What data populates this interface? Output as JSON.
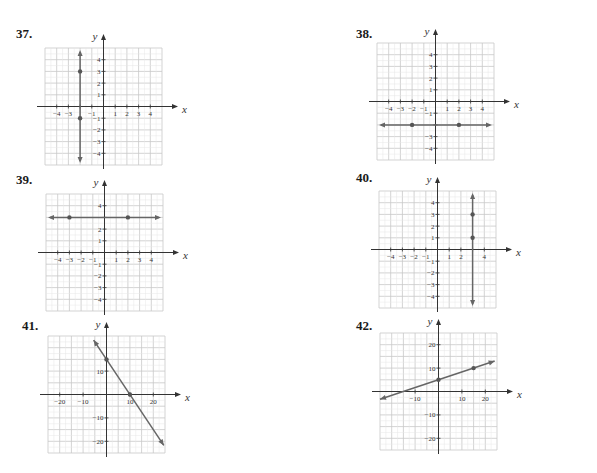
{
  "page": {
    "background": "#ffffff",
    "grid_color": "#c8c8c8",
    "axis_color": "#333333",
    "line_color": "#666666",
    "point_color": "#555555"
  },
  "problems": [
    {
      "number": "37.",
      "label_pos": [
        16,
        38
      ],
      "grid": {
        "left": 45,
        "top": 48,
        "cols": 10,
        "rows": 10,
        "cell": 11.7,
        "origin_col": 5,
        "origin_row": 5
      },
      "axis_labels": {
        "x": "x",
        "y": "y"
      },
      "x_ticks": [
        "−4",
        "−3",
        "",
        "−1",
        "1",
        "2",
        "3",
        "4"
      ],
      "x_tick_values": [
        -4,
        -3,
        -2,
        -1,
        1,
        2,
        3,
        4
      ],
      "y_ticks": [
        "4",
        "3",
        "2",
        "1",
        "−1",
        "−2",
        "−3",
        "−4"
      ],
      "y_tick_values": [
        4,
        3,
        2,
        1,
        -1,
        -2,
        -3,
        -4
      ],
      "unit": 1,
      "line": {
        "type": "vertical",
        "x": -2,
        "points": [
          [
            -2,
            3
          ],
          [
            -2,
            -1
          ]
        ]
      }
    },
    {
      "number": "38.",
      "label_pos": [
        356,
        38
      ],
      "grid": {
        "left": 377,
        "top": 43,
        "cols": 10,
        "rows": 10,
        "cell": 11.7,
        "origin_col": 5,
        "origin_row": 5
      },
      "axis_labels": {
        "x": "x",
        "y": "y"
      },
      "x_ticks": [
        "−4",
        "−3",
        "−2",
        "−1",
        "1",
        "2",
        "3",
        "4"
      ],
      "x_tick_values": [
        -4,
        -3,
        -2,
        -1,
        1,
        2,
        3,
        4
      ],
      "y_ticks": [
        "4",
        "3",
        "2",
        "1",
        "−1",
        "",
        "−3",
        "−4"
      ],
      "y_tick_values": [
        4,
        3,
        2,
        1,
        -1,
        -2,
        -3,
        -4
      ],
      "unit": 1,
      "line": {
        "type": "horizontal",
        "y": -2,
        "points": [
          [
            -2,
            -2
          ],
          [
            2,
            -2
          ]
        ]
      }
    },
    {
      "number": "39.",
      "label_pos": [
        16,
        184
      ],
      "grid": {
        "left": 46,
        "top": 194,
        "cols": 10,
        "rows": 10,
        "cell": 11.7,
        "origin_col": 5,
        "origin_row": 5
      },
      "axis_labels": {
        "x": "x",
        "y": "y"
      },
      "x_ticks": [
        "−4",
        "−3",
        "−2",
        "−1",
        "1",
        "2",
        "3",
        "4"
      ],
      "x_tick_values": [
        -4,
        -3,
        -2,
        -1,
        1,
        2,
        3,
        4
      ],
      "y_ticks": [
        "4",
        "",
        "2",
        "1",
        "−1",
        "−2",
        "−3",
        "−4"
      ],
      "y_tick_values": [
        4,
        3,
        2,
        1,
        -1,
        -2,
        -3,
        -4
      ],
      "unit": 1,
      "line": {
        "type": "horizontal",
        "y": 3,
        "points": [
          [
            -3,
            3
          ],
          [
            2,
            3
          ]
        ]
      }
    },
    {
      "number": "40.",
      "label_pos": [
        356,
        182
      ],
      "grid": {
        "left": 379,
        "top": 191,
        "cols": 10,
        "rows": 10,
        "cell": 11.7,
        "origin_col": 5,
        "origin_row": 5
      },
      "axis_labels": {
        "x": "x",
        "y": "y"
      },
      "x_ticks": [
        "−4",
        "−3",
        "−2",
        "−1",
        "1",
        "2",
        "",
        "4"
      ],
      "x_tick_values": [
        -4,
        -3,
        -2,
        -1,
        1,
        2,
        3,
        4
      ],
      "y_ticks": [
        "4",
        "3",
        "2",
        "1",
        "−1",
        "−2",
        "−3",
        "−4"
      ],
      "y_tick_values": [
        4,
        3,
        2,
        1,
        -1,
        -2,
        -3,
        -4
      ],
      "unit": 1,
      "line": {
        "type": "vertical",
        "x": 3,
        "points": [
          [
            3,
            3
          ],
          [
            3,
            1
          ]
        ]
      }
    },
    {
      "number": "41.",
      "label_pos": [
        22,
        330
      ],
      "grid": {
        "left": 48,
        "top": 336,
        "cols": 10,
        "rows": 10,
        "cell": 11.7,
        "origin_col": 5,
        "origin_row": 5
      },
      "axis_labels": {
        "x": "x",
        "y": "y"
      },
      "x_ticks": [
        "−20",
        "−10",
        "10",
        "20"
      ],
      "x_tick_values": [
        -20,
        -10,
        10,
        20
      ],
      "y_ticks": [
        "10",
        "−10",
        "−20"
      ],
      "y_tick_values": [
        10,
        -10,
        -20
      ],
      "unit": 5,
      "line": {
        "type": "sloped",
        "slope": -1.5,
        "intercept": 15,
        "x_range": [
          -5.5,
          24.5
        ],
        "points": [
          [
            0,
            15
          ],
          [
            10,
            0
          ]
        ]
      }
    },
    {
      "number": "42.",
      "label_pos": [
        356,
        330
      ],
      "grid": {
        "left": 380,
        "top": 333,
        "cols": 10,
        "rows": 10,
        "cell": 11.7,
        "origin_col": 5,
        "origin_row": 5
      },
      "axis_labels": {
        "x": "x",
        "y": "y"
      },
      "x_ticks": [
        "−10",
        "10",
        "20"
      ],
      "x_tick_values": [
        -10,
        10,
        20
      ],
      "y_ticks": [
        "20",
        "10",
        "−10",
        "−20"
      ],
      "y_tick_values": [
        20,
        10,
        -10,
        -20
      ],
      "unit": 5,
      "line": {
        "type": "sloped",
        "slope": 0.3333,
        "intercept": 5,
        "x_range": [
          -25,
          24
        ],
        "points": [
          [
            0,
            5
          ],
          [
            15,
            10
          ]
        ]
      }
    }
  ],
  "chart_data": [
    {
      "type": "line",
      "title": "37.",
      "xlabel": "x",
      "ylabel": "y",
      "xlim": [
        -5,
        5
      ],
      "ylim": [
        -5,
        5
      ],
      "grid": true,
      "equation": "x = -2",
      "points": [
        [
          -2,
          3
        ],
        [
          -2,
          -1
        ]
      ]
    },
    {
      "type": "line",
      "title": "38.",
      "xlabel": "x",
      "ylabel": "y",
      "xlim": [
        -5,
        5
      ],
      "ylim": [
        -5,
        5
      ],
      "grid": true,
      "equation": "y = -2",
      "points": [
        [
          -2,
          -2
        ],
        [
          2,
          -2
        ]
      ]
    },
    {
      "type": "line",
      "title": "39.",
      "xlabel": "x",
      "ylabel": "y",
      "xlim": [
        -5,
        5
      ],
      "ylim": [
        -5,
        5
      ],
      "grid": true,
      "equation": "y = 3",
      "points": [
        [
          -3,
          3
        ],
        [
          2,
          3
        ]
      ]
    },
    {
      "type": "line",
      "title": "40.",
      "xlabel": "x",
      "ylabel": "y",
      "xlim": [
        -5,
        5
      ],
      "ylim": [
        -5,
        5
      ],
      "grid": true,
      "equation": "x = 3",
      "points": [
        [
          3,
          3
        ],
        [
          3,
          1
        ]
      ]
    },
    {
      "type": "line",
      "title": "41.",
      "xlabel": "x",
      "ylabel": "y",
      "xlim": [
        -25,
        25
      ],
      "ylim": [
        -25,
        25
      ],
      "grid": true,
      "equation": "y = -1.5x + 15",
      "points": [
        [
          0,
          15
        ],
        [
          10,
          0
        ]
      ]
    },
    {
      "type": "line",
      "title": "42.",
      "xlabel": "x",
      "ylabel": "y",
      "xlim": [
        -25,
        25
      ],
      "ylim": [
        -25,
        25
      ],
      "grid": true,
      "equation": "y = x/3 + 5",
      "points": [
        [
          0,
          5
        ],
        [
          15,
          10
        ]
      ]
    }
  ]
}
